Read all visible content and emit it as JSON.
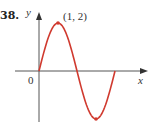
{
  "problem_number": "38.",
  "labels": {
    "y_axis": "y",
    "x_axis": "x",
    "origin": "0",
    "point": "(1, 2)"
  },
  "colors": {
    "curve": "#d03a2f",
    "axes": "#555555"
  },
  "chart_data": {
    "type": "line",
    "title": "38.",
    "xlabel": "x",
    "ylabel": "y",
    "series": [
      {
        "name": "curve",
        "x": [
          0,
          0.5,
          1,
          1.5,
          2,
          2.5,
          3,
          3.5,
          4
        ],
        "values": [
          0,
          1.414,
          2,
          1.414,
          0,
          -1.414,
          -2,
          -1.414,
          0
        ]
      }
    ],
    "annotations": [
      {
        "text": "(1, 2)",
        "x": 1,
        "y": 2
      },
      {
        "text": "0",
        "x": 0,
        "y": 0
      }
    ],
    "marked_points": [
      {
        "x": 1,
        "y": 2
      },
      {
        "x": 3,
        "y": -2
      }
    ],
    "xlim": [
      -1.3,
      5.7
    ],
    "ylim": [
      -2.1,
      2.4
    ],
    "grid": false,
    "legend": "none"
  }
}
